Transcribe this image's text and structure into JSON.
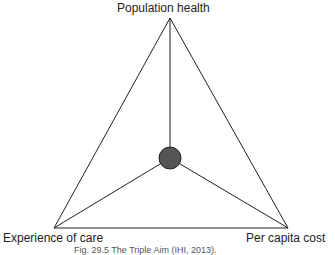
{
  "diagram": {
    "title": "The Triple Aim",
    "vertices": {
      "top": {
        "label": "Population health",
        "x": 170,
        "y": 18
      },
      "left": {
        "label": "Experience of care",
        "x": 54,
        "y": 228
      },
      "right": {
        "label": "Per capita cost",
        "x": 288,
        "y": 228
      }
    },
    "center": {
      "x": 170,
      "y": 158,
      "r": 11,
      "fill": "#555555"
    },
    "line_color": "#222222"
  },
  "caption": "Fig. 29.5  The Triple Aim (IHI, 2013)."
}
